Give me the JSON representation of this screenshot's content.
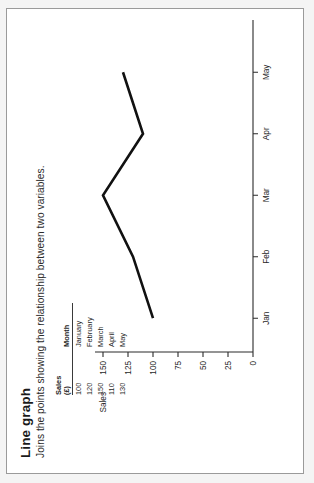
{
  "card": {
    "title": "Line graph",
    "description": "Joins the points showing the relationship between two variables."
  },
  "table": {
    "headers": {
      "sales": "Sales",
      "sales_unit": "(£)",
      "month": "Month"
    },
    "rows": [
      {
        "sales": "100",
        "month": "January"
      },
      {
        "sales": "120",
        "month": "February"
      },
      {
        "sales": "150",
        "month": "March"
      },
      {
        "sales": "110",
        "month": "April"
      },
      {
        "sales": "130",
        "month": "May"
      }
    ]
  },
  "chart_data": {
    "type": "line",
    "title": "Line graph",
    "xlabel": "",
    "ylabel": "Sales",
    "categories": [
      "Jan",
      "Feb",
      "Mar",
      "Apr",
      "May"
    ],
    "values": [
      100,
      120,
      150,
      110,
      130
    ],
    "ylim": [
      0,
      150
    ],
    "yticks": [
      "0",
      "25",
      "50",
      "75",
      "100",
      "125",
      "150"
    ],
    "ytick_values": [
      0,
      25,
      50,
      75,
      100,
      125,
      150
    ],
    "xticks": [
      "Jan",
      "Feb",
      "Mar",
      "Apr",
      "May"
    ],
    "grid": false,
    "legend": "none",
    "series_color": "#111111"
  },
  "axis": {
    "y_name": "Sales",
    "y_labels": [
      "150",
      "125",
      "100",
      "75",
      "50",
      "25",
      "0"
    ],
    "x_labels": [
      "Jan",
      "Feb",
      "Mar",
      "Apr",
      "May"
    ]
  }
}
